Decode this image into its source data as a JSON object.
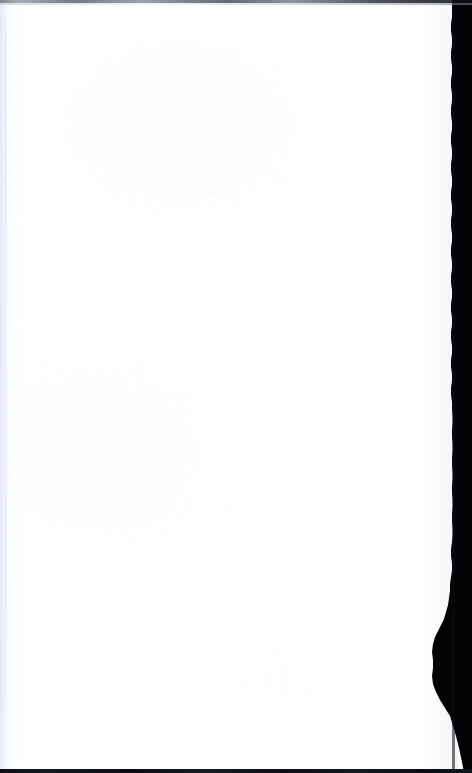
{
  "page": {
    "kind": "scanned-document-page",
    "state": "blank",
    "width": 472,
    "height": 773,
    "caption": ""
  },
  "colors": {
    "paper": "#ffffff",
    "paper_left_tint": "#f2f4fa",
    "edge_shadow": "#030305",
    "scan_line_top": "#5e636c",
    "scan_line_bottom": "#0d0f13",
    "hairline": "#c4cad8"
  },
  "regions": {
    "top_scan_line": {
      "label": "",
      "y": 0,
      "height": 3
    },
    "bottom_scan_line": {
      "label": "",
      "y": 769,
      "height": 4
    },
    "left_margin": {
      "label": "",
      "x": 0,
      "width": 14
    },
    "right_edge_shadow": {
      "label": "",
      "x": 412,
      "width": 60,
      "notes": ""
    }
  },
  "content": {
    "text_blocks": [],
    "figures": [],
    "visible_text": ""
  }
}
